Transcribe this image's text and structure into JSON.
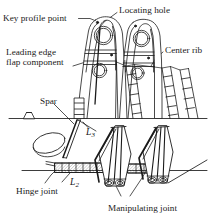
{
  "figure": {
    "kind": "engineering-line-drawing",
    "background_color": "#ffffff",
    "line_color": "#1a1a1a",
    "hatch_color": "#555555"
  },
  "labels": {
    "key_profile_point": "Key profile point",
    "locating_hole": "Locating hole",
    "leading_edge_flap_component_line1": "Leading edge",
    "leading_edge_flap_component_line2": "flap component",
    "center_rib": "Center rib",
    "spar": "Spar",
    "hinge_joint": "Hinge joint",
    "manipulating_joint": "Manipulating joint"
  },
  "dimensions": {
    "l3_symbol": "L",
    "l3_subscript": "3",
    "l2_symbol": "L",
    "l2_subscript": "2"
  },
  "components": {
    "rib_count": 2,
    "locating_hole_count": 2,
    "manipulating_joint_count": 2,
    "hinge_rail_segments": 9
  }
}
